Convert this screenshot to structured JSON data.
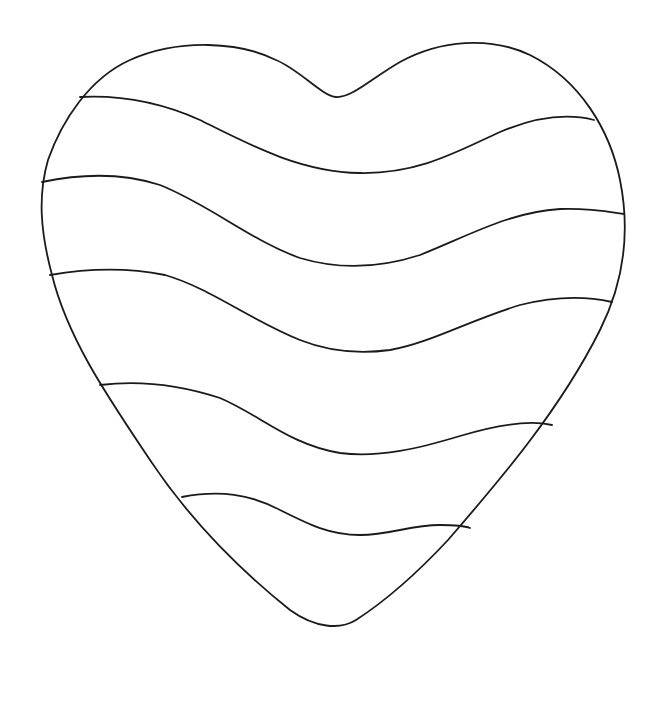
{
  "artwork": {
    "title": "Striped heart coloring page",
    "subject": "heart",
    "style": "line-art",
    "stripe_count": 5,
    "band_count": 6,
    "colors": {
      "background": "#ffffff",
      "stroke": "#1a1a1a"
    }
  }
}
